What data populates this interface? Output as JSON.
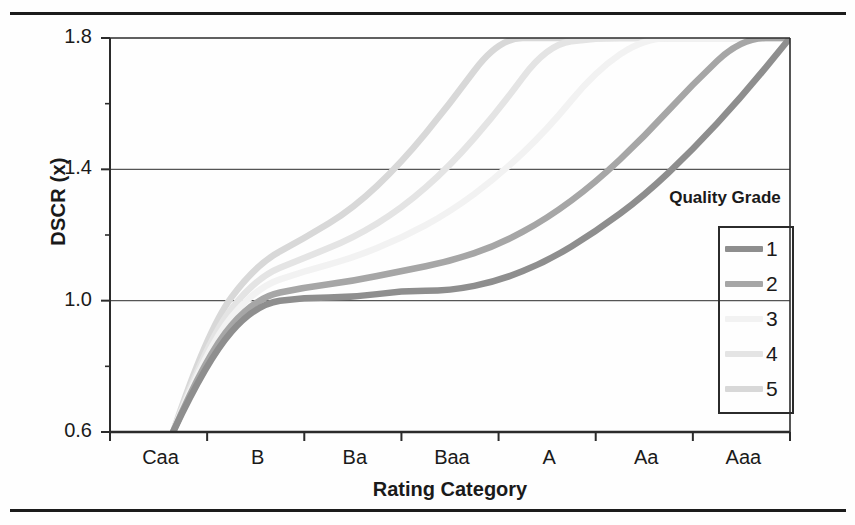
{
  "figure": {
    "type": "scanned-chart-figure"
  },
  "chart_data": {
    "type": "line",
    "title": "",
    "xlabel": "Rating Category",
    "ylabel": "DSCR (x)",
    "xtick_labels": [
      "Caa",
      "B",
      "Ba",
      "Baa",
      "A",
      "Aa",
      "Aaa"
    ],
    "ytick_labels": [
      "0.6",
      "1.0",
      "1.4",
      "1.8"
    ],
    "ytick_values": [
      0.6,
      1.0,
      1.4,
      1.8
    ],
    "ylim": [
      0.6,
      1.8
    ],
    "xlim": [
      0,
      7
    ],
    "y_minor_ticks": [
      0.8,
      1.2,
      1.6
    ],
    "gridlines_y": [
      1.0,
      1.4
    ],
    "grid": true,
    "legend_title": "Quality Grade",
    "legend_position": "right-inside",
    "x": [
      0.65,
      1.0,
      1.5,
      2.0,
      2.5,
      3.0,
      3.5,
      4.0,
      4.5,
      5.0,
      5.5,
      6.0,
      6.5,
      7.0
    ],
    "series": [
      {
        "name": "1",
        "label": "1",
        "color": "#8e8e8e",
        "values": [
          0.6,
          0.82,
          0.99,
          1.01,
          1.01,
          1.03,
          1.03,
          1.06,
          1.12,
          1.21,
          1.32,
          1.46,
          1.62,
          1.8
        ]
      },
      {
        "name": "2",
        "label": "2",
        "color": "#a6a6a6",
        "values": [
          0.6,
          0.84,
          1.01,
          1.04,
          1.06,
          1.09,
          1.12,
          1.17,
          1.25,
          1.36,
          1.5,
          1.66,
          1.8,
          1.8
        ]
      },
      {
        "name": "3",
        "label": "3",
        "color": "#f2f2f2",
        "values": [
          0.6,
          0.86,
          1.04,
          1.09,
          1.13,
          1.19,
          1.27,
          1.38,
          1.52,
          1.7,
          1.8,
          1.8,
          1.8,
          1.8
        ]
      },
      {
        "name": "4",
        "label": "4",
        "color": "#e4e4e4",
        "values": [
          0.6,
          0.88,
          1.07,
          1.13,
          1.19,
          1.28,
          1.41,
          1.58,
          1.78,
          1.8,
          1.8,
          1.8,
          1.8,
          1.8
        ]
      },
      {
        "name": "5",
        "label": "5",
        "color": "#d8d8d8",
        "values": [
          0.6,
          0.91,
          1.11,
          1.19,
          1.28,
          1.42,
          1.6,
          1.8,
          1.8,
          1.8,
          1.8,
          1.8,
          1.8,
          1.8
        ]
      }
    ]
  },
  "colors": {
    "axis": "#2b2b2b",
    "grid": "#555555",
    "rule": "#1c1c1c",
    "background": "#fefefe"
  }
}
